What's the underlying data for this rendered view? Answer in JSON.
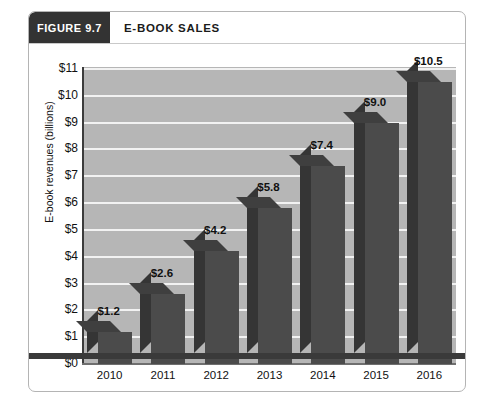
{
  "figure": {
    "badge_label": "FIGURE 9.7",
    "title": "E-BOOK SALES"
  },
  "colors": {
    "badge_background": "#333333",
    "plot_background": "#b6b6b6",
    "gridline": "#f2f2f2",
    "bar_front": "#4b4b4b",
    "bar_side": "#353535",
    "bar_top": "#3f3f3f",
    "axis_line": "#3c3c3c",
    "bottom_rule": "#3a3a3a",
    "card_border": "#b4b4b4",
    "text": "#111111"
  },
  "chart_data": {
    "type": "bar",
    "title": "E-BOOK SALES",
    "xlabel": "",
    "ylabel": "E-book revenues  (billions)",
    "categories": [
      "2010",
      "2011",
      "2012",
      "2013",
      "2014",
      "2015",
      "2016"
    ],
    "values": [
      1.2,
      2.6,
      4.2,
      5.8,
      7.4,
      9.0,
      10.5
    ],
    "data_labels": [
      "$1.2",
      "$2.6",
      "$4.2",
      "$5.8",
      "$7.4",
      "$9.0",
      "$10.5"
    ],
    "ylim": [
      0,
      11
    ],
    "ytick_values": [
      0,
      1,
      2,
      3,
      4,
      5,
      6,
      7,
      8,
      9,
      10,
      11
    ],
    "ytick_labels": [
      "$0",
      "$1",
      "$2",
      "$3",
      "$4",
      "$5",
      "$6",
      "$7",
      "$8",
      "$9",
      "$10",
      "$11"
    ],
    "grid": true,
    "legend": false,
    "style": "3d-column"
  }
}
